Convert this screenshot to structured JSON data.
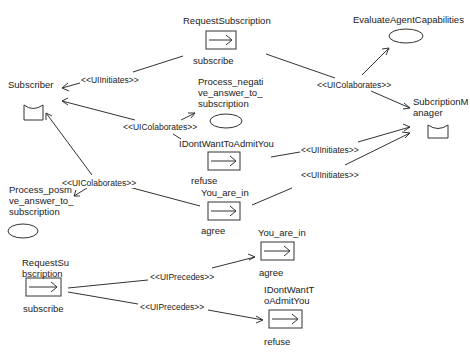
{
  "diagram": {
    "nodes": {
      "request_subscription_top": {
        "name": "RequestSubscription",
        "caption": "subscribe",
        "kind": "interaction"
      },
      "evaluate_agent_capabilities": {
        "name": "EvaluateAgentCapabilities",
        "kind": "task"
      },
      "subscriber": {
        "name": "Subscriber",
        "kind": "role"
      },
      "process_negative": {
        "name": "Process_negati\nve_answer_to_\nsubscription",
        "kind": "task"
      },
      "subscription_manager": {
        "name": "SubcriptionM\nanager",
        "kind": "role"
      },
      "idontwant_mid": {
        "name": "IDontWantToAdmitYou",
        "caption": "refuse",
        "kind": "interaction"
      },
      "you_are_in_mid": {
        "name": "You_are_in",
        "caption": "agree",
        "kind": "interaction"
      },
      "process_positive": {
        "name": "Process_posm\nve_answer_to_\nsubscription",
        "kind": "task"
      },
      "request_subscription_bottom": {
        "name": "RequestSu\nbscription",
        "caption": "subscribe",
        "kind": "interaction"
      },
      "you_are_in_bottom": {
        "name": "You_are_in",
        "caption": "agree",
        "kind": "interaction"
      },
      "idontwant_bottom": {
        "name": "IDontWantT\noAdmitYou",
        "caption": "refuse",
        "kind": "interaction"
      }
    },
    "edges": {
      "e1": "<<UIInitiates>>",
      "e2": "<<UIColaborates>>",
      "e3": "<<UIColaborates>>",
      "e4": "<<UIColaborates>>",
      "e5": "<<UIInitiates>>",
      "e6": "<<UIInitiates>>",
      "e7": "<<UIPrecedes>>",
      "e8": "<<UIPrecedes>>"
    }
  }
}
